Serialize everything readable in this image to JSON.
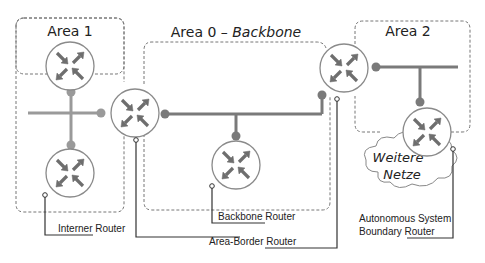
{
  "areas": [
    {
      "id": "area1",
      "title": "Area 1"
    },
    {
      "id": "area0",
      "title": "Area 0 – ",
      "title_italic": "Backbone"
    },
    {
      "id": "area2",
      "title": "Area 2"
    }
  ],
  "cloud": {
    "line1": "Weitere",
    "line2": "Netze"
  },
  "labels": {
    "internal": "Interner Router",
    "backbone": "Backbone Router",
    "abr": "Area-Border Router",
    "asbr_line1": "Autonomous System",
    "asbr_line2": "Boundary Router"
  },
  "icons": {
    "router": "router-icon"
  },
  "colors": {
    "link": "#7f7f7f",
    "link_area1": "#9a9a9a",
    "border": "#777777",
    "router_stroke": "#8a8a8a",
    "arrow": "#6e6e6e"
  }
}
